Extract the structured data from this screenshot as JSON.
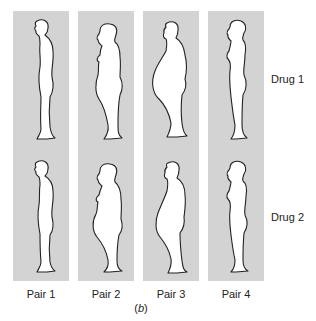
{
  "figure": {
    "caption_label": "b",
    "row_labels": [
      "Drug 1",
      "Drug 2"
    ],
    "pairs": [
      {
        "label": "Pair 1",
        "drug1_silhouette": "slim-man-profile",
        "drug2_silhouette": "slim-man-profile"
      },
      {
        "label": "Pair 2",
        "drug1_silhouette": "heavier-woman-profile",
        "drug2_silhouette": "heavier-woman-profile"
      },
      {
        "label": "Pair 3",
        "drug1_silhouette": "obese-man-profile",
        "drug2_silhouette": "heavy-man-profile"
      },
      {
        "label": "Pair 4",
        "drug1_silhouette": "slim-woman-profile",
        "drug2_silhouette": "slim-woman-profile"
      }
    ],
    "colors": {
      "panel": "#d3d3d3",
      "silhouette_fill": "#ffffff",
      "outline": "#222222"
    }
  }
}
